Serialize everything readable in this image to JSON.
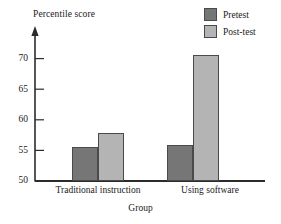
{
  "chart_data": {
    "type": "bar",
    "title": "",
    "subtitle": "",
    "xlabel": "Group",
    "ylabel": "Percentile score",
    "categories": [
      "Traditional instruction",
      "Using software"
    ],
    "series": [
      {
        "name": "Pretest",
        "color": "#767676",
        "values": [
          55.0,
          55.3
        ]
      },
      {
        "name": "Post-test",
        "color": "#b4b4b4",
        "values": [
          57.0,
          68.3
        ]
      }
    ],
    "ylim": [
      50,
      71.5
    ],
    "yticks": [
      50,
      55,
      60,
      65,
      70
    ],
    "ytick_labels": [
      "50",
      "55",
      "60",
      "65",
      "70"
    ],
    "grid": false,
    "legend_position": "top-right",
    "annotations": []
  },
  "axis": {
    "arrow_on_yaxis": true,
    "line_color": "#2b2b2b"
  }
}
